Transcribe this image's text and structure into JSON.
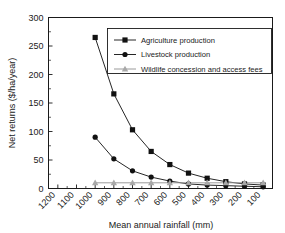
{
  "chart_data": {
    "type": "line",
    "title": "",
    "xlabel": "Mean annual rainfall (mm)",
    "ylabel": "Net returns ($/ha/year)",
    "x": [
      1200,
      1100,
      1000,
      900,
      800,
      700,
      600,
      500,
      400,
      300,
      200,
      100
    ],
    "categories": [
      "1200",
      "1100",
      "1000",
      "900",
      "800",
      "700",
      "600",
      "500",
      "400",
      "300",
      "200",
      "100"
    ],
    "xlim": [
      1250,
      50
    ],
    "x_axis_direction": "descending",
    "ylim": [
      0,
      300
    ],
    "yticks": [
      0,
      50,
      100,
      150,
      200,
      250,
      300
    ],
    "ytick_labels": [
      "0",
      "50",
      "100",
      "150",
      "200",
      "250",
      "300"
    ],
    "grid": false,
    "legend_position": "upper-right-inside",
    "series": [
      {
        "name": "Agriculture production",
        "marker": "square",
        "color": "#111111",
        "x": [
          1000,
          900,
          800,
          700,
          600,
          500,
          400,
          300,
          200,
          100
        ],
        "values": [
          265,
          166,
          103,
          65,
          42,
          27,
          18,
          12,
          8,
          6
        ]
      },
      {
        "name": "Livestock production",
        "marker": "circle",
        "color": "#111111",
        "x": [
          1000,
          900,
          800,
          700,
          600,
          500,
          400,
          300,
          200,
          100
        ],
        "values": [
          90,
          52,
          31,
          20,
          13,
          8,
          6,
          5,
          4,
          3
        ]
      },
      {
        "name": "Wildlife concession and access fees",
        "marker": "triangle",
        "color": "#a8a8a8",
        "x": [
          1000,
          900,
          800,
          700,
          600,
          500,
          400,
          300,
          200,
          100
        ],
        "values": [
          10,
          10,
          10,
          10,
          10,
          10,
          10,
          10,
          10,
          10
        ]
      }
    ]
  },
  "axes": {
    "y_title": "Net returns ($/ha/year)",
    "x_title": "Mean annual rainfall (mm)",
    "y_ticks": [
      "300",
      "250",
      "200",
      "150",
      "100",
      "50",
      "0"
    ],
    "x_ticks": [
      "1200",
      "1100",
      "1000",
      "900",
      "800",
      "700",
      "600",
      "500",
      "400",
      "300",
      "200",
      "100"
    ]
  },
  "legend": {
    "items": [
      {
        "label": "Agriculture production",
        "marker": "square-marker",
        "color": "#111111"
      },
      {
        "label": "Livestock production",
        "marker": "circle-marker",
        "color": "#111111"
      },
      {
        "label": "Wildlife concession and access fees",
        "marker": "triangle-marker",
        "color": "#a8a8a8"
      }
    ]
  }
}
